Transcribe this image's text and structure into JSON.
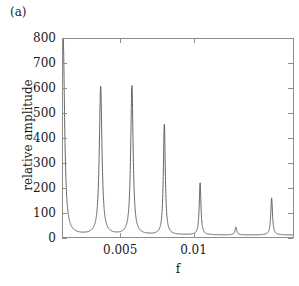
{
  "figure": {
    "panel_label": "(a)",
    "background_color": "#ffffff",
    "line_color": "#555555",
    "axis_color": "#8d8d8d"
  },
  "axes": {
    "xlabel": "f",
    "ylabel": "relative amplitude",
    "x_ticks": [
      {
        "value": 0.005,
        "label": "0.005"
      },
      {
        "value": 0.01,
        "label": "0.01"
      }
    ],
    "y_ticks": [
      {
        "value": 0,
        "label": "0"
      },
      {
        "value": 100,
        "label": "100"
      },
      {
        "value": 200,
        "label": "200"
      },
      {
        "value": 300,
        "label": "300"
      },
      {
        "value": 400,
        "label": "400"
      },
      {
        "value": 500,
        "label": "500"
      },
      {
        "value": 600,
        "label": "600"
      },
      {
        "value": 700,
        "label": "700"
      },
      {
        "value": 800,
        "label": "800"
      }
    ]
  },
  "chart_data": {
    "type": "line",
    "title": "(a)",
    "xlabel": "f",
    "ylabel": "relative amplitude",
    "xlim": [
      0.00103,
      0.01685
    ],
    "ylim": [
      0,
      800
    ],
    "grid": false,
    "legend": null,
    "baseline": 8,
    "peaks": [
      {
        "f": 0.00104,
        "amplitude": 800,
        "clipped": true,
        "width": 0.00012
      },
      {
        "f": 0.00362,
        "amplitude": 598,
        "clipped": false,
        "width": 0.00011
      },
      {
        "f": 0.00577,
        "amplitude": 601,
        "clipped": false,
        "width": 0.0001
      },
      {
        "f": 0.008,
        "amplitude": 446,
        "clipped": false,
        "width": 8e-05
      },
      {
        "f": 0.01046,
        "amplitude": 210,
        "clipped": false,
        "width": 7e-05
      },
      {
        "f": 0.01292,
        "amplitude": 32,
        "clipped": false,
        "width": 7e-05
      },
      {
        "f": 0.01538,
        "amplitude": 150,
        "clipped": false,
        "width": 7e-05
      }
    ]
  }
}
